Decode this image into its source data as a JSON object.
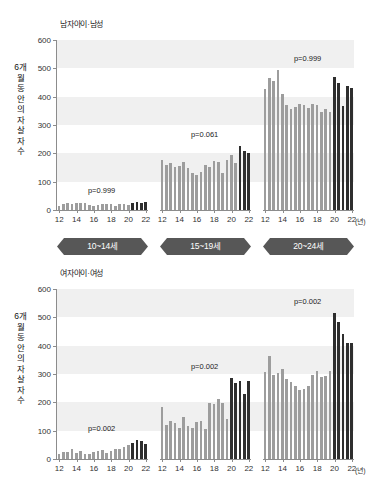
{
  "figure": {
    "x_unit": "(년)",
    "age_bands": [
      "10~14세",
      "15~19세",
      "20~24세"
    ],
    "colors": {
      "bar_light": "#9d9d9d",
      "bar_dark": "#2e2e2e",
      "band": "#f0f0f0",
      "banner": "#575757",
      "axis": "#8c8c8c"
    }
  },
  "chart_data": [
    {
      "type": "bar",
      "title": "남자아이·남성",
      "ylabel": "6개월 동안의 자살자 수",
      "xlabel": "(년)",
      "ylim": [
        0,
        600
      ],
      "yticks": [
        0,
        100,
        200,
        300,
        400,
        500,
        600
      ],
      "grid": "alternating horizontal bands at 100-200, 300-400, 500-600",
      "legend": "none",
      "panels": [
        {
          "name": "10~14세",
          "annotation": "p=0.999",
          "xticks": [
            12,
            14,
            16,
            18,
            20,
            22
          ],
          "x": [
            12.0,
            12.5,
            13.0,
            13.5,
            14.0,
            14.5,
            15.0,
            15.5,
            16.0,
            16.5,
            17.0,
            17.5,
            18.0,
            18.5,
            19.0,
            19.5,
            20.0,
            20.5,
            21.0,
            21.5,
            22.0
          ],
          "values": [
            14,
            22,
            25,
            20,
            26,
            24,
            23,
            18,
            13,
            17,
            21,
            22,
            20,
            14,
            22,
            20,
            16,
            24,
            29,
            26,
            28
          ],
          "dark_from_index": 17
        },
        {
          "name": "15~19세",
          "annotation": "p=0.061",
          "xticks": [
            12,
            14,
            16,
            18,
            20,
            22
          ],
          "x": [
            12.0,
            12.5,
            13.0,
            13.5,
            14.0,
            14.5,
            15.0,
            15.5,
            16.0,
            16.5,
            17.0,
            17.5,
            18.0,
            18.5,
            19.0,
            19.5,
            20.0,
            20.5,
            21.0,
            21.5,
            22.0
          ],
          "values": [
            177,
            158,
            166,
            153,
            155,
            170,
            147,
            131,
            125,
            135,
            158,
            153,
            172,
            170,
            132,
            178,
            193,
            166,
            226,
            208,
            202
          ],
          "dark_from_index": 18
        },
        {
          "name": "20~24세",
          "annotation": "p=0.999",
          "xticks": [
            12,
            14,
            16,
            18,
            20,
            22
          ],
          "x": [
            12.0,
            12.5,
            13.0,
            13.5,
            14.0,
            14.5,
            15.0,
            15.5,
            16.0,
            16.5,
            17.0,
            17.5,
            18.0,
            18.5,
            19.0,
            19.5,
            20.0,
            20.5,
            21.0,
            21.5,
            22.0
          ],
          "values": [
            428,
            466,
            455,
            494,
            411,
            372,
            358,
            362,
            375,
            371,
            361,
            375,
            370,
            345,
            355,
            347,
            470,
            450,
            368,
            436,
            430
          ],
          "dark_from_index": 16
        }
      ]
    },
    {
      "type": "bar",
      "title": "여자아이·여성",
      "ylabel": "6개월 동안의 자살자 수",
      "xlabel": "(년)",
      "ylim": [
        0,
        600
      ],
      "yticks": [
        0,
        100,
        200,
        300,
        400,
        500,
        600
      ],
      "grid": "alternating horizontal bands at 100-200, 300-400, 500-600",
      "legend": "none",
      "panels": [
        {
          "name": "10~14세",
          "annotation": "p=0.002",
          "xticks": [
            12,
            14,
            16,
            18,
            20,
            22
          ],
          "x": [
            12.0,
            12.5,
            13.0,
            13.5,
            14.0,
            14.5,
            15.0,
            15.5,
            16.0,
            16.5,
            17.0,
            17.5,
            18.0,
            18.5,
            19.0,
            19.5,
            20.0,
            20.5,
            21.0,
            21.5,
            22.0
          ],
          "values": [
            18,
            24,
            26,
            34,
            22,
            28,
            17,
            19,
            24,
            28,
            31,
            22,
            27,
            34,
            36,
            42,
            49,
            57,
            66,
            62,
            52
          ],
          "dark_from_index": 17
        },
        {
          "name": "15~19세",
          "annotation": "p=0.002",
          "xticks": [
            12,
            14,
            16,
            18,
            20,
            22
          ],
          "x": [
            12.0,
            12.5,
            13.0,
            13.5,
            14.0,
            14.5,
            15.0,
            15.5,
            16.0,
            16.5,
            17.0,
            17.5,
            18.0,
            18.5,
            19.0,
            19.5,
            20.0,
            20.5,
            21.0,
            21.5,
            22.0
          ],
          "values": [
            182,
            121,
            134,
            126,
            110,
            148,
            118,
            110,
            132,
            133,
            107,
            196,
            195,
            212,
            196,
            141,
            287,
            268,
            277,
            231,
            276
          ],
          "dark_from_index": 16
        },
        {
          "name": "20~24세",
          "annotation": "p=0.002",
          "xticks": [
            12,
            14,
            16,
            18,
            20,
            22
          ],
          "x": [
            12.0,
            12.5,
            13.0,
            13.5,
            14.0,
            14.5,
            15.0,
            15.5,
            16.0,
            16.5,
            17.0,
            17.5,
            18.0,
            18.5,
            19.0,
            19.5,
            20.0,
            20.5,
            21.0,
            21.5,
            22.0
          ],
          "values": [
            308,
            364,
            296,
            302,
            316,
            283,
            272,
            256,
            243,
            248,
            259,
            295,
            310,
            288,
            292,
            311,
            514,
            483,
            442,
            411,
            411
          ],
          "dark_from_index": 16
        }
      ]
    }
  ]
}
